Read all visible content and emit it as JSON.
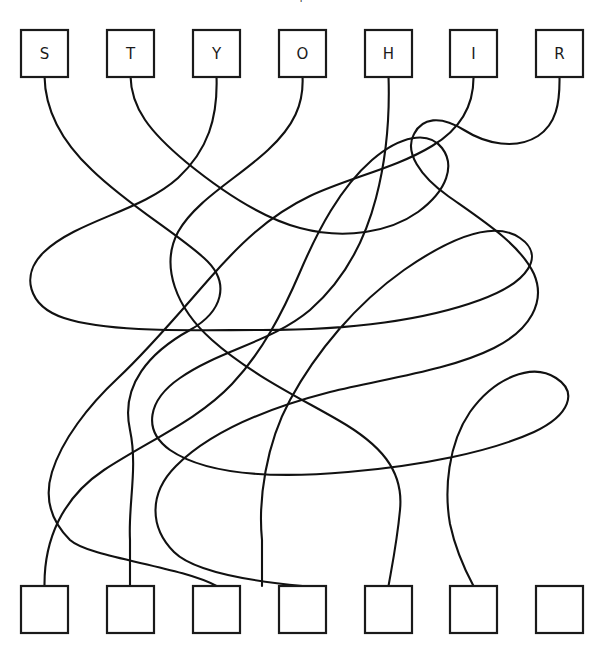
{
  "puzzle": {
    "type": "tangled-lines",
    "title_fragment": "|",
    "canvas": {
      "width": 602,
      "height": 653,
      "background": "#ffffff"
    },
    "stroke_color": "#111111",
    "box_stroke_color": "#1a1a1a",
    "box_fill": "#ffffff",
    "box_size": 47,
    "top_row": {
      "y": 30,
      "boxes": [
        {
          "letter": "S",
          "x": 21,
          "cx": 44.5
        },
        {
          "letter": "T",
          "x": 107,
          "cx": 130.5
        },
        {
          "letter": "Y",
          "x": 193,
          "cx": 216.5
        },
        {
          "letter": "O",
          "x": 279,
          "cx": 302.5
        },
        {
          "letter": "H",
          "x": 365,
          "cx": 388.5
        },
        {
          "letter": "I",
          "x": 450,
          "cx": 473.5
        },
        {
          "letter": "R",
          "x": 536,
          "cx": 559.5
        }
      ]
    },
    "bottom_row": {
      "y": 586,
      "boxes": [
        {
          "letter": "",
          "x": 21,
          "cx": 44.5
        },
        {
          "letter": "",
          "x": 107,
          "cx": 130.5
        },
        {
          "letter": "",
          "x": 193,
          "cx": 216.5
        },
        {
          "letter": "",
          "x": 279,
          "cx": 302.5
        },
        {
          "letter": "",
          "x": 365,
          "cx": 388.5
        },
        {
          "letter": "",
          "x": 450,
          "cx": 473.5
        },
        {
          "letter": "",
          "x": 536,
          "cx": 559.5
        }
      ]
    },
    "lines": [
      {
        "name": "line-from-S",
        "start_letter": "S",
        "path": "M 44.5 76 C 45 110 60 140 92 170 C 128 205 175 232 204 258 C 232 283 222 312 190 330 C 150 352 120 385 130 430 C 138 468 128 505 130 540 L 130 586"
      },
      {
        "name": "line-from-T",
        "start_letter": "T",
        "path": "M 130.5 76 C 131 108 150 132 186 162 C 224 193 262 218 300 228 C 345 240 390 232 418 212 C 448 190 455 165 442 148 C 428 130 400 136 372 160 C 340 188 318 230 300 272 C 282 314 262 352 232 384 C 198 420 150 440 104 470 C 62 498 44 540 44.5 586"
      },
      {
        "name": "line-from-Y",
        "start_letter": "Y",
        "path": "M 216.5 76 C 218 118 208 150 178 178 C 140 212 78 220 44 252 C 20 275 28 306 64 318 C 110 333 190 330 262 330 C 340 330 420 322 480 300 C 530 282 545 255 520 238 C 494 220 450 238 404 270 C 356 304 316 352 290 400 C 266 444 258 500 262 540 L 262 586"
      },
      {
        "name": "line-from-O",
        "start_letter": "O",
        "path": "M 302.5 76 C 304 104 294 126 268 150 C 238 178 196 200 178 232 C 160 266 176 308 212 340 C 250 374 300 398 338 420 C 380 444 404 470 400 510 C 397 542 392 566 388.5 586"
      },
      {
        "name": "line-from-H",
        "start_letter": "H",
        "path": "M 388.5 76 C 390 120 386 160 376 198 C 364 244 342 282 310 310 C 272 342 220 350 180 378 C 148 400 142 430 170 450 C 208 476 280 478 348 472 C 420 466 490 452 534 432 C 570 415 578 392 556 378 C 532 362 494 378 470 412 C 448 444 444 490 450 524 C 456 552 466 572 473.5 586"
      },
      {
        "name": "line-from-I",
        "start_letter": "I",
        "path": "M 473.5 76 C 474 104 462 128 432 146 C 396 168 348 178 310 196 C 268 216 238 246 210 278 C 180 312 150 348 118 378 C 88 406 62 440 52 472 C 44 498 50 520 70 540 C 90 558 180 566 216.5 586"
      },
      {
        "name": "line-from-R",
        "start_letter": "R",
        "path": "M 559.5 76 C 560 104 556 124 538 136 C 516 150 486 144 464 130 C 440 115 422 118 414 134 C 404 152 420 176 448 196 C 482 220 520 244 534 274 C 546 302 530 330 494 348 C 450 370 388 378 330 392 C 268 408 210 432 176 466 C 148 494 150 528 174 552 C 196 574 260 582 302.5 586"
      }
    ]
  }
}
